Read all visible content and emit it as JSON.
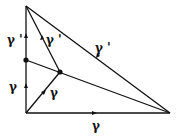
{
  "diagram": {
    "vertices": {
      "top": [
        26,
        6
      ],
      "left_mid": [
        26,
        60
      ],
      "bottom_left": [
        26,
        113
      ],
      "interior": [
        60,
        72
      ],
      "right": [
        170,
        113
      ]
    },
    "labels": [
      {
        "id": "left-upper",
        "text": "γ '",
        "x": 9,
        "y": 44
      },
      {
        "id": "diag-upper",
        "text": "γ '",
        "x": 46,
        "y": 44
      },
      {
        "id": "hyp",
        "text": "γ '",
        "x": 96,
        "y": 52
      },
      {
        "id": "left-lower",
        "text": "γ",
        "x": 10,
        "y": 90
      },
      {
        "id": "diag-lower",
        "text": "γ",
        "x": 50,
        "y": 97
      },
      {
        "id": "bottom",
        "text": "γ",
        "x": 93,
        "y": 130
      }
    ],
    "stroke_color": "#111111"
  }
}
